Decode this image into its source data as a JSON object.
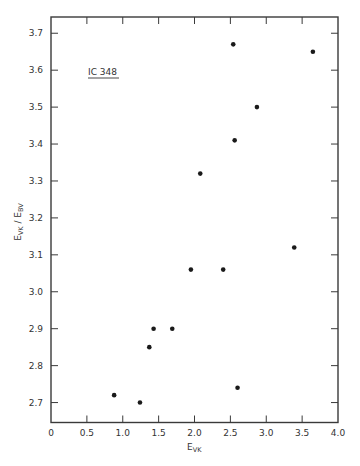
{
  "chart_data": {
    "type": "scatter",
    "title": "",
    "annotation": "IC 348",
    "xlabel": "E_VK",
    "xlabel_main": "E",
    "xlabel_sub": "VK",
    "ylabel": "E_VK / E_BV",
    "ylabel_parts": {
      "num_main": "E",
      "num_sub": "VK",
      "sep": " / ",
      "den_main": "E",
      "den_sub": "BV"
    },
    "xlim": [
      0,
      4.0
    ],
    "ylim": [
      2.646,
      3.744
    ],
    "xticks": [
      0,
      0.5,
      1.0,
      1.5,
      2.0,
      2.5,
      3.0,
      3.5,
      4.0
    ],
    "xtick_labels": [
      "0",
      "0.5",
      "1.0",
      "1.5",
      "2.0",
      "2.5",
      "3.0",
      "3.5",
      "4.0"
    ],
    "yticks": [
      2.7,
      2.8,
      2.9,
      3.0,
      3.1,
      3.2,
      3.3,
      3.4,
      3.5,
      3.6,
      3.7
    ],
    "ytick_labels": [
      "2.7",
      "2.8",
      "2.9",
      "3.0",
      "3.1",
      "3.2",
      "3.3",
      "3.4",
      "3.5",
      "3.6",
      "3.7"
    ],
    "grid": false,
    "legend": null,
    "marker_color": "#1a1a1a",
    "axis_color": "#3a3a3a",
    "points": [
      {
        "x": 0.88,
        "y": 2.72
      },
      {
        "x": 1.24,
        "y": 2.7
      },
      {
        "x": 1.37,
        "y": 2.85
      },
      {
        "x": 1.43,
        "y": 2.9
      },
      {
        "x": 1.69,
        "y": 2.9
      },
      {
        "x": 1.95,
        "y": 3.06
      },
      {
        "x": 2.4,
        "y": 3.06
      },
      {
        "x": 2.08,
        "y": 3.32
      },
      {
        "x": 2.54,
        "y": 3.67
      },
      {
        "x": 2.56,
        "y": 3.41
      },
      {
        "x": 2.87,
        "y": 3.5
      },
      {
        "x": 3.65,
        "y": 3.65
      },
      {
        "x": 3.39,
        "y": 3.12
      },
      {
        "x": 2.6,
        "y": 2.74
      }
    ]
  }
}
